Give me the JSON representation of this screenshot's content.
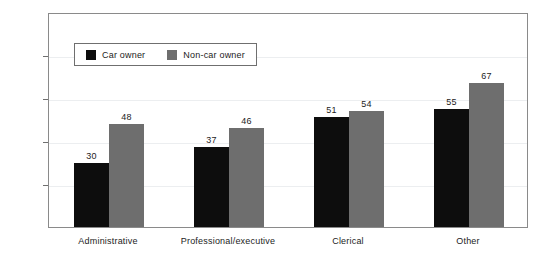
{
  "chart_data": {
    "type": "bar",
    "title": "",
    "xlabel": "",
    "ylabel": "% smokers",
    "ylim": [
      0,
      100
    ],
    "yticks": [
      0,
      20,
      40,
      60,
      80,
      100
    ],
    "ytick_labels": [
      "0",
      "20",
      "40",
      "60",
      "80",
      "100"
    ],
    "grid": true,
    "grid_axis": "y",
    "legend_position": "upper-left-inside",
    "categories": [
      "Administrative",
      "Professional/executive",
      "Clerical",
      "Other"
    ],
    "series": [
      {
        "name": "Car owner",
        "color": "#0d0d0d",
        "values": [
          30,
          37,
          51,
          55
        ],
        "value_labels": [
          "30",
          "37",
          "51",
          "55"
        ]
      },
      {
        "name": "Non-car owner",
        "color": "#6e6e6e",
        "values": [
          48,
          46,
          54,
          67
        ],
        "value_labels": [
          "48",
          "46",
          "54",
          "67"
        ]
      }
    ]
  },
  "axis": {
    "y_title": "% smokers"
  },
  "legend": {
    "items": [
      {
        "label": "Car owner",
        "swatch": "legend-swatch-car-owner"
      },
      {
        "label": "Non-car owner",
        "swatch": "legend-swatch-non-car-owner"
      }
    ]
  }
}
